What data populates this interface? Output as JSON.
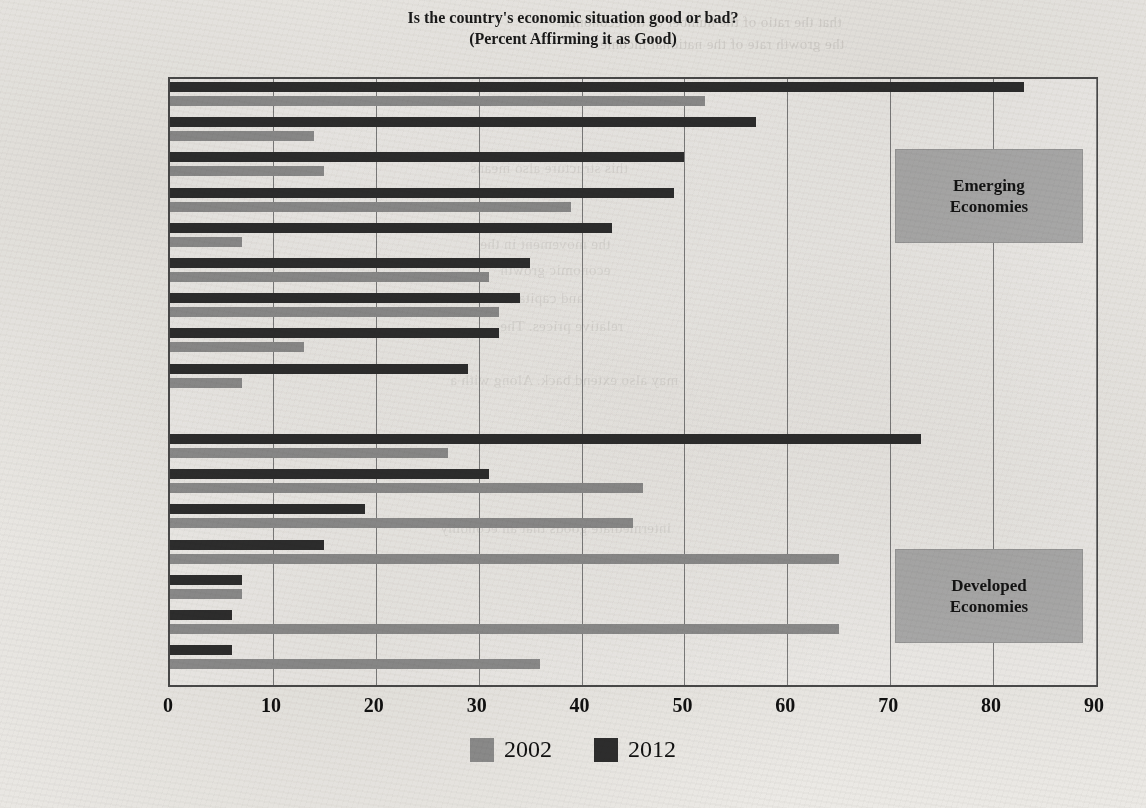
{
  "chart_data": {
    "type": "bar",
    "orientation": "horizontal",
    "title": "Is the country's economic situation good or bad?",
    "subtitle": "(Percent Affirming it as Good)",
    "xlabel": "",
    "ylabel": "",
    "xlim": [
      0,
      90
    ],
    "xticks": [
      0,
      10,
      20,
      30,
      40,
      50,
      60,
      70,
      80,
      90
    ],
    "grid": "vertical",
    "legend_position": "bottom-center",
    "categories": [
      "China",
      "Turkey",
      "Indonesia",
      "India",
      "Kenya",
      "Mexico",
      "Nigeria",
      "Russia",
      "Poland",
      "Germany",
      "United States",
      "France",
      "Britain",
      "Japan",
      "Spain",
      "Italy"
    ],
    "series": [
      {
        "name": "2002",
        "color": "#8d8d8d",
        "values": [
          52,
          14,
          15,
          39,
          7,
          31,
          32,
          13,
          7,
          27,
          46,
          45,
          65,
          7,
          65,
          36
        ]
      },
      {
        "name": "2012",
        "color": "#2e2e2e",
        "values": [
          83,
          57,
          50,
          49,
          43,
          35,
          34,
          32,
          29,
          73,
          31,
          19,
          15,
          7,
          6,
          6
        ]
      }
    ],
    "groups": [
      {
        "label": "Emerging\nEconomies",
        "label_line1": "Emerging",
        "label_line2": "Economies",
        "members": [
          "China",
          "Turkey",
          "Indonesia",
          "India",
          "Kenya",
          "Mexico",
          "Nigeria",
          "Russia",
          "Poland"
        ]
      },
      {
        "label": "Developed\nEconomies",
        "label_line1": "Developed",
        "label_line2": "Economies",
        "members": [
          "Germany",
          "United States",
          "France",
          "Britain",
          "Japan",
          "Spain",
          "Italy"
        ]
      }
    ],
    "annotations": [
      {
        "text": "Emerging Economies",
        "box_color": "#acacac"
      },
      {
        "text": "Developed Economies",
        "box_color": "#acacac"
      }
    ]
  },
  "legend": {
    "entries": [
      {
        "label": "2002",
        "color": "#8d8d8d"
      },
      {
        "label": "2012",
        "color": "#2e2e2e"
      }
    ]
  },
  "colors": {
    "series_2002": "#8d8d8d",
    "series_2012": "#2e2e2e",
    "group_box": "#acacac",
    "frame": "#4a4a4a",
    "gridline": "#7d7d7d",
    "paper": "#eceae6"
  },
  "background_bleed": [
    "that the ratio of the number of the economic",
    "the growth rate of the national income",
    "this structure also means",
    "the movement in the",
    "economic growth",
    "and capital, while",
    "relative prices. The",
    "may also extend back. Along with a",
    "intermediate goods that an economy"
  ]
}
